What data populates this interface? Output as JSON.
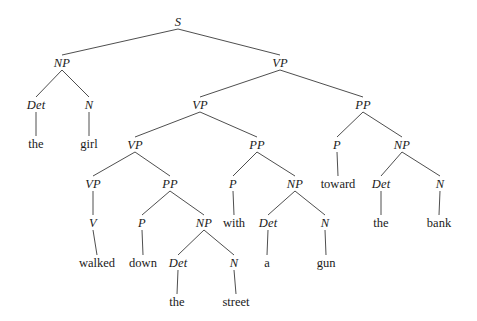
{
  "figure": {
    "type": "constituency-parse-tree",
    "sentence": "the girl walked down the street with a gun toward the bank",
    "background_color": "#ffffff",
    "line_color": "#3a3a3a",
    "text_color": "#1a1a1a"
  },
  "nodes": [
    {
      "id": "n0",
      "label": "S",
      "kind": "nonterminal",
      "x": 178,
      "y": 22
    },
    {
      "id": "n1",
      "label": "NP",
      "kind": "nonterminal",
      "x": 62,
      "y": 63
    },
    {
      "id": "n2",
      "label": "VP",
      "kind": "nonterminal",
      "x": 280,
      "y": 63
    },
    {
      "id": "n3",
      "label": "Det",
      "kind": "nonterminal",
      "x": 36,
      "y": 105
    },
    {
      "id": "n4",
      "label": "N",
      "kind": "nonterminal",
      "x": 89,
      "y": 105
    },
    {
      "id": "n5",
      "label": "the",
      "kind": "terminal",
      "x": 36,
      "y": 144
    },
    {
      "id": "n6",
      "label": "girl",
      "kind": "terminal",
      "x": 89,
      "y": 144
    },
    {
      "id": "n7",
      "label": "VP",
      "kind": "nonterminal",
      "x": 200,
      "y": 105
    },
    {
      "id": "n8",
      "label": "PP",
      "kind": "nonterminal",
      "x": 363,
      "y": 105
    },
    {
      "id": "n9",
      "label": "VP",
      "kind": "nonterminal",
      "x": 135,
      "y": 145
    },
    {
      "id": "n10",
      "label": "PP",
      "kind": "nonterminal",
      "x": 257,
      "y": 145
    },
    {
      "id": "n11",
      "label": "P",
      "kind": "nonterminal",
      "x": 337,
      "y": 145
    },
    {
      "id": "n12",
      "label": "NP",
      "kind": "nonterminal",
      "x": 402,
      "y": 145
    },
    {
      "id": "n13",
      "label": "VP",
      "kind": "nonterminal",
      "x": 93,
      "y": 184
    },
    {
      "id": "n14",
      "label": "PP",
      "kind": "nonterminal",
      "x": 170,
      "y": 184
    },
    {
      "id": "n15",
      "label": "P",
      "kind": "nonterminal",
      "x": 233,
      "y": 184
    },
    {
      "id": "n16",
      "label": "NP",
      "kind": "nonterminal",
      "x": 295,
      "y": 184
    },
    {
      "id": "n17",
      "label": "toward",
      "kind": "terminal",
      "x": 338,
      "y": 184
    },
    {
      "id": "n18",
      "label": "Det",
      "kind": "nonterminal",
      "x": 381,
      "y": 184
    },
    {
      "id": "n19",
      "label": "N",
      "kind": "nonterminal",
      "x": 440,
      "y": 184
    },
    {
      "id": "n20",
      "label": "V",
      "kind": "nonterminal",
      "x": 93,
      "y": 223
    },
    {
      "id": "n21",
      "label": "P",
      "kind": "nonterminal",
      "x": 142,
      "y": 223
    },
    {
      "id": "n22",
      "label": "NP",
      "kind": "nonterminal",
      "x": 204,
      "y": 223
    },
    {
      "id": "n23",
      "label": "with",
      "kind": "terminal",
      "x": 234,
      "y": 223
    },
    {
      "id": "n24",
      "label": "Det",
      "kind": "nonterminal",
      "x": 268,
      "y": 223
    },
    {
      "id": "n25",
      "label": "N",
      "kind": "nonterminal",
      "x": 325,
      "y": 223
    },
    {
      "id": "n26",
      "label": "the",
      "kind": "terminal",
      "x": 381,
      "y": 223
    },
    {
      "id": "n27",
      "label": "bank",
      "kind": "terminal",
      "x": 439,
      "y": 223
    },
    {
      "id": "n28",
      "label": "walked",
      "kind": "terminal",
      "x": 97,
      "y": 263
    },
    {
      "id": "n29",
      "label": "down",
      "kind": "terminal",
      "x": 143,
      "y": 263
    },
    {
      "id": "n30",
      "label": "Det",
      "kind": "nonterminal",
      "x": 178,
      "y": 263
    },
    {
      "id": "n31",
      "label": "N",
      "kind": "nonterminal",
      "x": 234,
      "y": 263
    },
    {
      "id": "n32",
      "label": "a",
      "kind": "terminal",
      "x": 267,
      "y": 263
    },
    {
      "id": "n33",
      "label": "gun",
      "kind": "terminal",
      "x": 326,
      "y": 263
    },
    {
      "id": "n34",
      "label": "the",
      "kind": "terminal",
      "x": 177,
      "y": 302
    },
    {
      "id": "n35",
      "label": "street",
      "kind": "terminal",
      "x": 236,
      "y": 302
    }
  ],
  "edges": [
    {
      "from": "n0",
      "to": "n1"
    },
    {
      "from": "n0",
      "to": "n2"
    },
    {
      "from": "n1",
      "to": "n3"
    },
    {
      "from": "n1",
      "to": "n4"
    },
    {
      "from": "n3",
      "to": "n5"
    },
    {
      "from": "n4",
      "to": "n6"
    },
    {
      "from": "n2",
      "to": "n7"
    },
    {
      "from": "n2",
      "to": "n8"
    },
    {
      "from": "n7",
      "to": "n9"
    },
    {
      "from": "n7",
      "to": "n10"
    },
    {
      "from": "n8",
      "to": "n11"
    },
    {
      "from": "n8",
      "to": "n12"
    },
    {
      "from": "n9",
      "to": "n13"
    },
    {
      "from": "n9",
      "to": "n14"
    },
    {
      "from": "n10",
      "to": "n15"
    },
    {
      "from": "n10",
      "to": "n16"
    },
    {
      "from": "n11",
      "to": "n17"
    },
    {
      "from": "n12",
      "to": "n18"
    },
    {
      "from": "n12",
      "to": "n19"
    },
    {
      "from": "n13",
      "to": "n20"
    },
    {
      "from": "n14",
      "to": "n21"
    },
    {
      "from": "n14",
      "to": "n22"
    },
    {
      "from": "n15",
      "to": "n23"
    },
    {
      "from": "n16",
      "to": "n24"
    },
    {
      "from": "n16",
      "to": "n25"
    },
    {
      "from": "n18",
      "to": "n26"
    },
    {
      "from": "n19",
      "to": "n27"
    },
    {
      "from": "n20",
      "to": "n28"
    },
    {
      "from": "n21",
      "to": "n29"
    },
    {
      "from": "n22",
      "to": "n30"
    },
    {
      "from": "n22",
      "to": "n31"
    },
    {
      "from": "n24",
      "to": "n32"
    },
    {
      "from": "n25",
      "to": "n33"
    },
    {
      "from": "n30",
      "to": "n34"
    },
    {
      "from": "n31",
      "to": "n35"
    }
  ]
}
